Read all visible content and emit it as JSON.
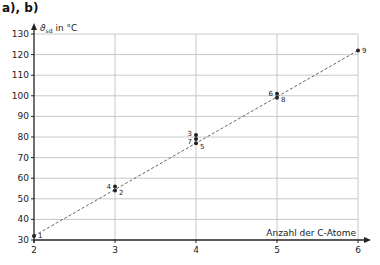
{
  "heading": "a), b)",
  "chart_data": {
    "type": "scatter",
    "title": "a), b)",
    "xlabel": "Anzahl der C-Atome",
    "ylabel": "ϑsd in °C",
    "ylabel_main": "ϑ",
    "ylabel_sub": "sd",
    "ylabel_unit": " in °C",
    "xlim": [
      2,
      6
    ],
    "ylim": [
      30,
      130
    ],
    "x_ticks": [
      2,
      3,
      4,
      5,
      6
    ],
    "y_ticks": [
      30,
      40,
      50,
      60,
      70,
      80,
      90,
      100,
      110,
      120,
      130
    ],
    "grid": true,
    "points": [
      {
        "label": "1",
        "x": 2,
        "y": 32
      },
      {
        "label": "2",
        "x": 3,
        "y": 54
      },
      {
        "label": "3",
        "x": 4,
        "y": 81
      },
      {
        "label": "4",
        "x": 3,
        "y": 56
      },
      {
        "label": "5",
        "x": 4,
        "y": 77
      },
      {
        "label": "6",
        "x": 5,
        "y": 101
      },
      {
        "label": "7",
        "x": 4,
        "y": 79
      },
      {
        "label": "8",
        "x": 5,
        "y": 99
      },
      {
        "label": "9",
        "x": 6,
        "y": 122
      }
    ],
    "trend_line": {
      "style": "dashed",
      "from": {
        "x": 2,
        "y": 32
      },
      "to": {
        "x": 6,
        "y": 122
      }
    }
  },
  "colors": {
    "grid": "#c8c8c8",
    "axis": "#222222",
    "point": "#222222",
    "trend": "#555555"
  }
}
